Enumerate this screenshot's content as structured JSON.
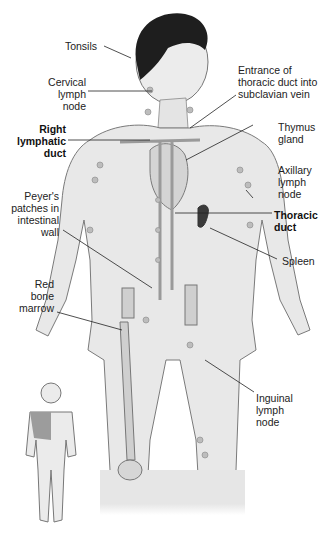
{
  "diagram": {
    "labels_left": [
      {
        "id": "tonsils",
        "text": "Tonsils",
        "bold": false
      },
      {
        "id": "cervical",
        "text": "Cervical\nlymph\nnode",
        "bold": false
      },
      {
        "id": "right-lymphatic-duct",
        "text": "Right\nlymphatic\nduct",
        "bold": true
      },
      {
        "id": "peyers",
        "text": "Peyer's\npatches in\nintestinal\nwall",
        "bold": false
      },
      {
        "id": "red-bone-marrow",
        "text": "Red\nbone\nmarrow",
        "bold": false
      }
    ],
    "labels_right": [
      {
        "id": "thoracic-entrance",
        "text": "Entrance of\nthoracic duct into\nsubclavian vein",
        "bold": false
      },
      {
        "id": "thymus",
        "text": "Thymus\ngland",
        "bold": false
      },
      {
        "id": "axillary",
        "text": "Axillary\nlymph\nnode",
        "bold": false
      },
      {
        "id": "thoracic-duct",
        "text": "Thoracic\nduct",
        "bold": true
      },
      {
        "id": "spleen",
        "text": "Spleen",
        "bold": false
      },
      {
        "id": "inguinal",
        "text": "Inguinal\nlymph\nnode",
        "bold": false
      }
    ],
    "inset": {
      "description": "Small full-body figure with shaded upper right quadrant (right lymphatic duct drainage region)"
    },
    "colors": {
      "body": "#e9e9e9",
      "outline": "#7a7a7a",
      "hair": "#222222",
      "vessel": "#9a9a9a",
      "node": "#b5b5b5",
      "shade": "#9c9c9c"
    }
  }
}
